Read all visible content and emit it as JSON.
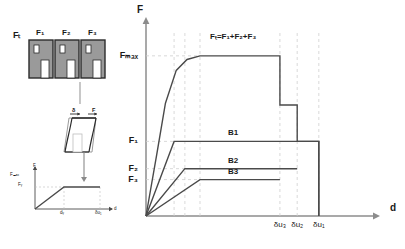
{
  "figure": {
    "title_equation": "Fₜ=F₁+F₂+F₃",
    "axis_y_label": "F",
    "axis_x_label": "d"
  },
  "building_group": {
    "applied_force_label": "Fₜ",
    "bay_labels": [
      "F₁",
      "F₂",
      "F₃"
    ],
    "fill_color": "#9a9a9a",
    "outline_color": "#2b2b2b"
  },
  "frame_inset": {
    "drift_label": "δ",
    "force_label": "F"
  },
  "bilinear_inset": {
    "axis_y_label": "F",
    "axis_x_label": "d",
    "y_ticks": [
      "Fₘₐₓ",
      "Fᵧ"
    ],
    "x_ticks": [
      "dᵧ",
      "δu₁"
    ]
  },
  "chart_data": {
    "type": "line",
    "title": "Fₜ=F₁+F₂+F₃",
    "xlabel": "d",
    "ylabel": "F",
    "xlim": [
      0,
      100
    ],
    "ylim": [
      0,
      100
    ],
    "grid": "dashed-guides-only",
    "legend": "inline-curve-labels",
    "y_ticks": [
      {
        "label": "Fₘₐₓ",
        "value": 88
      },
      {
        "label": "F₁",
        "value": 41
      },
      {
        "label": "F₂",
        "value": 26
      },
      {
        "label": "F₃",
        "value": 20
      }
    ],
    "x_ticks": [
      {
        "label": "δu₃",
        "value": 62
      },
      {
        "label": "δu₂",
        "value": 70
      },
      {
        "label": "δu₁",
        "value": 80
      }
    ],
    "series": [
      {
        "name": "Fₜ=F₁+F₂+F₃",
        "label": "Fₜ=F₁+F₂+F₃",
        "color": "#4a4a4a",
        "points": [
          [
            0,
            0
          ],
          [
            5,
            34
          ],
          [
            9,
            62
          ],
          [
            14,
            80
          ],
          [
            19,
            86
          ],
          [
            25,
            88
          ],
          [
            62,
            88
          ],
          [
            62,
            61
          ],
          [
            70,
            61
          ],
          [
            70,
            41
          ],
          [
            80,
            41
          ],
          [
            80,
            0
          ]
        ]
      },
      {
        "name": "B1",
        "label": "B1",
        "color": "#4a4a4a",
        "points": [
          [
            0,
            0
          ],
          [
            13,
            41
          ],
          [
            80,
            41
          ],
          [
            80,
            0
          ]
        ]
      },
      {
        "name": "B2",
        "label": "B2",
        "color": "#4a4a4a",
        "points": [
          [
            0,
            0
          ],
          [
            18,
            26
          ],
          [
            70,
            26
          ]
        ]
      },
      {
        "name": "B3",
        "label": "B3",
        "color": "#4a4a4a",
        "points": [
          [
            0,
            0
          ],
          [
            25,
            20
          ],
          [
            62,
            20
          ]
        ]
      }
    ],
    "guide_lines_x": [
      13,
      18,
      25,
      62,
      70,
      80
    ],
    "guide_lines_y": [
      88,
      41,
      26,
      20
    ]
  }
}
